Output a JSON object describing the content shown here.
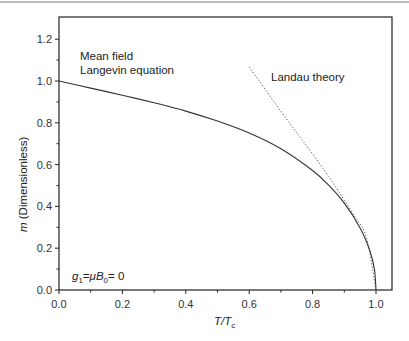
{
  "chart_data": {
    "type": "line",
    "title": "",
    "xlabel": "T/T_c",
    "ylabel": "m (Dimensionless)",
    "xlim": [
      0.0,
      1.05
    ],
    "ylim": [
      0.0,
      1.31
    ],
    "grid": false,
    "x_ticks": [
      "0.0",
      "0.2",
      "0.4",
      "0.6",
      "0.8",
      "1.0"
    ],
    "y_ticks": [
      "0.0",
      "0.2",
      "0.4",
      "0.6",
      "0.8",
      "1.0",
      "1.2"
    ],
    "series": [
      {
        "name": "Mean field Langevin equation",
        "style": "solid",
        "x": [
          0.0,
          0.1,
          0.2,
          0.3,
          0.4,
          0.5,
          0.6,
          0.7,
          0.8,
          0.85,
          0.9,
          0.95,
          0.98,
          0.995,
          1.0
        ],
        "values": [
          1.0,
          0.966,
          0.932,
          0.896,
          0.856,
          0.808,
          0.751,
          0.676,
          0.572,
          0.503,
          0.416,
          0.297,
          0.19,
          0.1,
          0.0
        ]
      },
      {
        "name": "Landau theory",
        "style": "dotted",
        "x": [
          0.6,
          0.7,
          0.767,
          0.85,
          0.934,
          0.97,
          1.0
        ],
        "values": [
          1.067,
          0.855,
          0.718,
          0.545,
          0.35,
          0.25,
          0.0
        ]
      }
    ],
    "annotations": [
      {
        "text_line1": "Mean field",
        "text_line2": "Langevin equation",
        "x": 0.065,
        "y": 1.12
      },
      {
        "text": "Landau theory",
        "x": 0.72,
        "y": 1.02
      },
      {
        "text": "g1=μB0= 0",
        "x": 0.04,
        "y": 0.05
      }
    ]
  },
  "labels": {
    "mean_field_line1": "Mean field",
    "mean_field_line2": "Langevin equation",
    "landau": "Landau theory",
    "g_label_g": "g",
    "g_label_sub1": "1",
    "g_label_mid": "=μB",
    "g_label_sub0": "0",
    "g_label_end": "= 0",
    "xlabel_T": "T/T",
    "xlabel_sub": "c",
    "ylabel_m": "m",
    "ylabel_rest": " (Dimensionless)"
  }
}
